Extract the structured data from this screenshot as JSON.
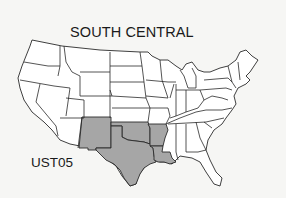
{
  "title": "SOUTH CENTRAL",
  "region_code": "UST05",
  "map": {
    "subject": "Contiguous United States",
    "highlighted_region": "South Central",
    "highlighted_states": [
      "New Mexico",
      "Texas",
      "Oklahoma",
      "Arkansas",
      "Louisiana"
    ],
    "colors": {
      "highlight_fill": "#a6a6a6",
      "state_fill": "#ffffff",
      "border": "#2a2a2a",
      "background": "#f6f6f4"
    }
  }
}
